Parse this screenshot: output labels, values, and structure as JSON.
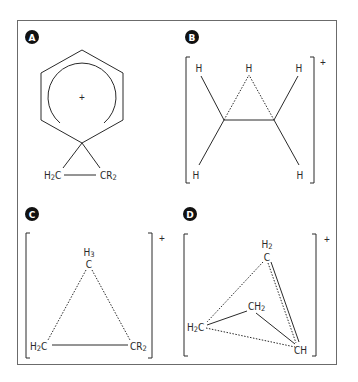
{
  "figure": {
    "panels": [
      {
        "id": "A",
        "badge": "A",
        "center_charge": "+",
        "labels": {
          "left": "H2C",
          "right": "CR2"
        },
        "description": "Spiro cyclopropane benzenium cation (arenium ion)"
      },
      {
        "id": "B",
        "badge": "B",
        "charge": "+",
        "labels": {
          "top_left": "H",
          "top_middle": "H",
          "top_right": "H",
          "bottom_left": "H",
          "bottom_right": "H"
        },
        "description": "Bridged protonated ethylene (hydrogen-bridged ethyl cation)"
      },
      {
        "id": "C",
        "badge": "C",
        "charge": "+",
        "labels": {
          "top_h": "H3",
          "top_c": "C",
          "left": "H2C",
          "right": "CR2"
        },
        "description": "Corner-protonated cyclopropane"
      },
      {
        "id": "D",
        "badge": "D",
        "charge": "+",
        "labels": {
          "top_h": "H2",
          "top_c": "C",
          "middle": "CH2",
          "left": "H2C",
          "right": "CH"
        },
        "description": "Bicyclobutonium-type nonclassical cation"
      }
    ],
    "colors": {
      "line": "#2a2a2a",
      "frame": "#6b6b6b",
      "badge": "#111111"
    }
  }
}
